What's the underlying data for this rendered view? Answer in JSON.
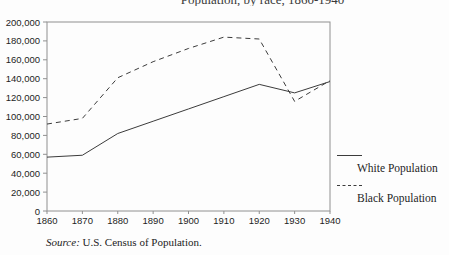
{
  "title_clipped": "Population, by race, 1860-1940",
  "chart_data": {
    "type": "line",
    "x": [
      1860,
      1870,
      1880,
      1890,
      1900,
      1910,
      1920,
      1930,
      1940
    ],
    "x_tick_labels": [
      "1860",
      "1870",
      "1880",
      "1890",
      "1900",
      "1910",
      "1920",
      "1930",
      "1940"
    ],
    "y_tick_labels": [
      "0",
      "20,000",
      "40,000",
      "60,000",
      "80,000",
      "100,000",
      "120,000",
      "140,000",
      "160,000",
      "180,000",
      "200,000"
    ],
    "ylim": [
      0,
      200000
    ],
    "y_tick_step": 20000,
    "grid": false,
    "legend_position": "right-outside",
    "series": [
      {
        "name": "White Population",
        "style": "solid",
        "values": [
          57000,
          59000,
          82000,
          95000,
          108000,
          121000,
          134000,
          125000,
          137000
        ]
      },
      {
        "name": "Black Population",
        "style": "dashed",
        "values": [
          92000,
          98000,
          141000,
          158000,
          172000,
          184000,
          182000,
          116000,
          138000
        ]
      }
    ]
  },
  "legend": {
    "items": [
      {
        "label": "White Population"
      },
      {
        "label": "Black Population"
      }
    ]
  },
  "source": {
    "prefix": "Source:",
    "text": " U.S. Census of Population."
  },
  "colors": {
    "line": "#3c3c3c",
    "frame": "#909090",
    "text": "#1e1e1e",
    "background": "#fdfdfd"
  }
}
